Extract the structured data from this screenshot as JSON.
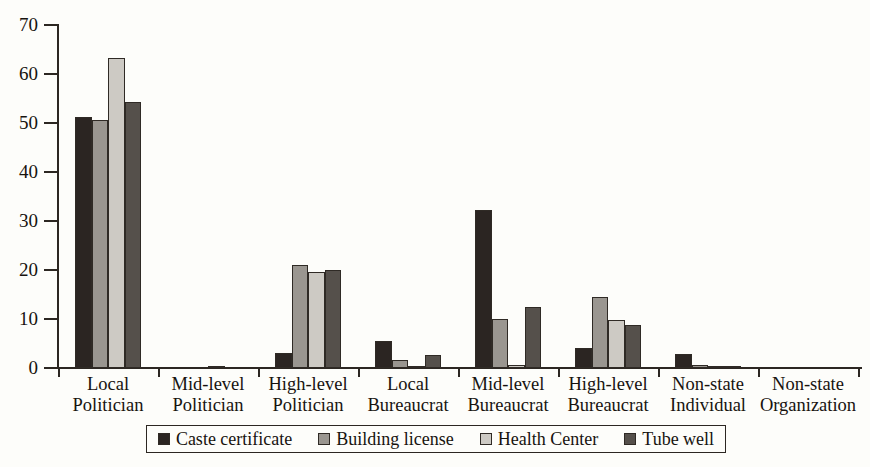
{
  "chart_data": {
    "type": "bar",
    "title": "",
    "subtitle": "",
    "xlabel": "",
    "ylabel": "",
    "ylim": [
      0,
      70
    ],
    "ytick_step": 10,
    "yticks": [
      70,
      60,
      50,
      40,
      30,
      20,
      10,
      0
    ],
    "grid": false,
    "legend_position": "bottom",
    "categories": [
      "Local Politician",
      "Mid-level Politician",
      "High-level Politician",
      "Local Bureaucrat",
      "Mid-level Bureaucrat",
      "High-level Bureaucrat",
      "Non-state Individual",
      "Non-state Organization"
    ],
    "category_lines": [
      [
        "Local",
        "Politician"
      ],
      [
        "Mid-level",
        "Politician"
      ],
      [
        "High-level",
        "Politician"
      ],
      [
        "Local",
        "Bureaucrat"
      ],
      [
        "Mid-level",
        "Bureaucrat"
      ],
      [
        "High-level",
        "Bureaucrat"
      ],
      [
        "Non-state",
        "Individual"
      ],
      [
        "Non-state",
        "Organization"
      ]
    ],
    "series": [
      {
        "name": "Caste certificate",
        "color": "#2b2522",
        "values": [
          51.3,
          0,
          3.0,
          5.6,
          32.3,
          4.1,
          2.8,
          0
        ]
      },
      {
        "name": "Building license",
        "color": "#9a9690",
        "values": [
          50.7,
          0,
          21.0,
          1.7,
          10.1,
          14.5,
          0.6,
          0
        ]
      },
      {
        "name": "Health Center",
        "color": "#cdcac4",
        "values": [
          63.2,
          0.4,
          19.6,
          0.3,
          0.7,
          9.9,
          0.5,
          0
        ]
      },
      {
        "name": "Tube well",
        "color": "#55504b",
        "values": [
          54.2,
          0,
          20.1,
          2.6,
          12.5,
          8.7,
          0.3,
          0
        ]
      }
    ]
  },
  "legend": {
    "items": [
      {
        "label": "Caste certificate",
        "color": "#2b2522"
      },
      {
        "label": "Building license",
        "color": "#9a9690"
      },
      {
        "label": "Health Center",
        "color": "#cdcac4"
      },
      {
        "label": "Tube well",
        "color": "#55504b"
      }
    ]
  }
}
